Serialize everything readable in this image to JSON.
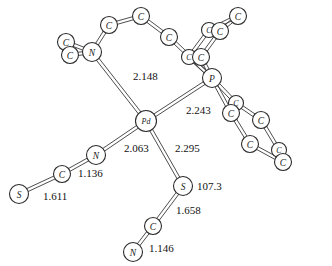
{
  "figure": {
    "type": "chemical-structure-diagram",
    "background_color": "#ffffff",
    "line_color": "#3a3a3a",
    "text_color": "#111111"
  },
  "chart_data": {
    "type": "diagram",
    "title": "",
    "xlabel": "",
    "ylabel": "",
    "atoms": [
      {
        "id": "Pd1",
        "element": "Pd",
        "label": "Pd",
        "x": 146,
        "y": 121,
        "r": 10.5
      },
      {
        "id": "N1",
        "element": "N",
        "label": "N",
        "x": 92,
        "y": 52,
        "r": 9.5
      },
      {
        "id": "C1",
        "element": "C",
        "label": "C",
        "x": 66,
        "y": 42,
        "r": 8.5
      },
      {
        "id": "C2",
        "element": "C",
        "label": "C",
        "x": 70,
        "y": 55,
        "r": 8.5
      },
      {
        "id": "C3",
        "element": "C",
        "label": "C",
        "x": 109,
        "y": 25,
        "r": 8.5
      },
      {
        "id": "C4",
        "element": "C",
        "label": "C",
        "x": 141,
        "y": 16,
        "r": 8.5
      },
      {
        "id": "C5",
        "element": "C",
        "label": "C",
        "x": 169,
        "y": 37,
        "r": 8.5
      },
      {
        "id": "P1",
        "element": "P",
        "label": "P",
        "x": 212,
        "y": 78,
        "r": 9.5
      },
      {
        "id": "C6",
        "element": "C",
        "label": "C",
        "x": 189,
        "y": 57,
        "r": 7.5
      },
      {
        "id": "C7",
        "element": "C",
        "label": "C",
        "x": 201,
        "y": 57,
        "r": 8.5
      },
      {
        "id": "C8",
        "element": "C",
        "label": "C",
        "x": 209,
        "y": 30,
        "r": 7.5
      },
      {
        "id": "C9",
        "element": "C",
        "label": "C",
        "x": 220,
        "y": 31,
        "r": 8.5
      },
      {
        "id": "C10",
        "element": "C",
        "label": "C",
        "x": 238,
        "y": 16,
        "r": 8.5
      },
      {
        "id": "C11",
        "element": "C",
        "label": "C",
        "x": 236,
        "y": 103,
        "r": 7.5
      },
      {
        "id": "C12",
        "element": "C",
        "label": "C",
        "x": 231,
        "y": 113,
        "r": 8.5
      },
      {
        "id": "C13",
        "element": "C",
        "label": "C",
        "x": 261,
        "y": 120,
        "r": 8.5
      },
      {
        "id": "C14",
        "element": "C",
        "label": "C",
        "x": 250,
        "y": 144,
        "r": 8.5
      },
      {
        "id": "C15",
        "element": "C",
        "label": "C",
        "x": 279,
        "y": 150,
        "r": 7.5
      },
      {
        "id": "C16",
        "element": "C",
        "label": "C",
        "x": 283,
        "y": 162,
        "r": 8.5
      },
      {
        "id": "N2",
        "element": "N",
        "label": "N",
        "x": 96,
        "y": 155,
        "r": 9.5
      },
      {
        "id": "C17",
        "element": "C",
        "label": "C",
        "x": 62,
        "y": 174,
        "r": 8.5
      },
      {
        "id": "S1",
        "element": "S",
        "label": "S",
        "x": 19,
        "y": 194,
        "r": 9.5
      },
      {
        "id": "S2",
        "element": "S",
        "label": "S",
        "x": 183,
        "y": 186,
        "r": 9.5
      },
      {
        "id": "C18",
        "element": "C",
        "label": "C",
        "x": 153,
        "y": 226,
        "r": 8.5
      },
      {
        "id": "N3",
        "element": "N",
        "label": "N",
        "x": 133,
        "y": 252,
        "r": 9.5
      }
    ],
    "bonds": [
      {
        "from": "Pd1",
        "to": "N1",
        "order": 1
      },
      {
        "from": "Pd1",
        "to": "P1",
        "order": 1
      },
      {
        "from": "Pd1",
        "to": "N2",
        "order": 1
      },
      {
        "from": "Pd1",
        "to": "S2",
        "order": 1
      },
      {
        "from": "N1",
        "to": "C1",
        "order": 1
      },
      {
        "from": "N1",
        "to": "C2",
        "order": 1
      },
      {
        "from": "N1",
        "to": "C3",
        "order": 1
      },
      {
        "from": "C3",
        "to": "C4",
        "order": 1
      },
      {
        "from": "C4",
        "to": "C5",
        "order": 1
      },
      {
        "from": "C5",
        "to": "P1",
        "order": 1
      },
      {
        "from": "P1",
        "to": "C6",
        "order": 1
      },
      {
        "from": "P1",
        "to": "C7",
        "order": 1
      },
      {
        "from": "C6",
        "to": "C8",
        "order": 1
      },
      {
        "from": "C7",
        "to": "C9",
        "order": 1
      },
      {
        "from": "C8",
        "to": "C10",
        "order": 1
      },
      {
        "from": "C9",
        "to": "C10",
        "order": 1
      },
      {
        "from": "P1",
        "to": "C11",
        "order": 1
      },
      {
        "from": "P1",
        "to": "C12",
        "order": 1
      },
      {
        "from": "C11",
        "to": "C13",
        "order": 1
      },
      {
        "from": "C12",
        "to": "C14",
        "order": 1
      },
      {
        "from": "C13",
        "to": "C15",
        "order": 1
      },
      {
        "from": "C14",
        "to": "C16",
        "order": 1
      },
      {
        "from": "C15",
        "to": "C16",
        "order": 1
      },
      {
        "from": "N2",
        "to": "C17",
        "order": 1
      },
      {
        "from": "C17",
        "to": "S1",
        "order": 1
      },
      {
        "from": "S2",
        "to": "C18",
        "order": 1
      },
      {
        "from": "C18",
        "to": "N3",
        "order": 1
      }
    ],
    "measurements": [
      {
        "name": "pd-n1-bond-length",
        "value": "2.148",
        "x": 133,
        "y": 76
      },
      {
        "name": "pd-p-bond-length",
        "value": "2.243",
        "x": 186,
        "y": 110
      },
      {
        "name": "pd-n2-bond-length",
        "value": "2.063",
        "x": 124,
        "y": 148
      },
      {
        "name": "pd-s2-bond-length",
        "value": "2.295",
        "x": 175,
        "y": 148
      },
      {
        "name": "n2-c17-bond-length",
        "value": "1.136",
        "x": 78,
        "y": 173
      },
      {
        "name": "c17-s1-bond-length",
        "value": "1.611",
        "x": 43,
        "y": 196
      },
      {
        "name": "pd-s2-c18-angle",
        "value": "107.3",
        "x": 197,
        "y": 186
      },
      {
        "name": "s2-c18-bond-length",
        "value": "1.658",
        "x": 176,
        "y": 210
      },
      {
        "name": "c18-n3-bond-length",
        "value": "1.146",
        "x": 149,
        "y": 248
      }
    ]
  }
}
